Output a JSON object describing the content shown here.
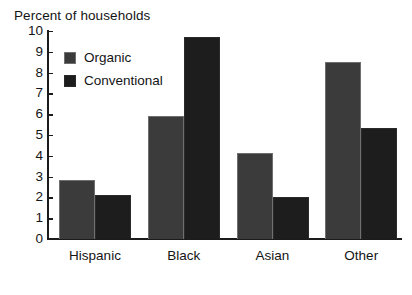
{
  "chart_data": {
    "type": "bar",
    "title": "Percent of households",
    "xlabel": "",
    "ylabel": "Percent of households",
    "ylim": [
      0,
      10
    ],
    "ytick_labels": [
      "10",
      "9",
      "8",
      "7",
      "6",
      "5",
      "4",
      "3",
      "2",
      "1",
      "0"
    ],
    "ytick_values": [
      10,
      9,
      8,
      7,
      6,
      5,
      4,
      3,
      2,
      1,
      0
    ],
    "grid": false,
    "legend_position": "upper-left-inside",
    "categories": [
      "Hispanic",
      "Black",
      "Asian",
      "Other"
    ],
    "series": [
      {
        "name": "Organic",
        "color": "#3b3b3b",
        "values": [
          2.85,
          5.9,
          4.15,
          8.5
        ]
      },
      {
        "name": "Conventional",
        "color": "#1d1d1d",
        "values": [
          2.1,
          9.7,
          2.0,
          5.35
        ]
      }
    ]
  },
  "colors": {
    "background": "#ffffff",
    "axis": "#1b1b1b",
    "text": "#141414",
    "organic": "#3b3b3b",
    "conventional": "#1d1d1d"
  }
}
